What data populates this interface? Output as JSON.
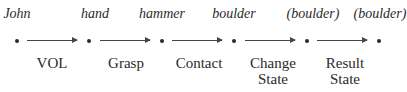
{
  "nodes": [
    {
      "label": "John",
      "x": 17
    },
    {
      "label": "hand",
      "x": 89
    },
    {
      "label": "hammer",
      "x": 162
    },
    {
      "label": "boulder",
      "x": 234
    },
    {
      "label": "(boulder)",
      "x": 307
    },
    {
      "label": "(boulder)",
      "x": 379
    }
  ],
  "edges": [
    {
      "line1": "VOL",
      "line2": ""
    },
    {
      "line1": "Grasp",
      "line2": ""
    },
    {
      "line1": "Contact",
      "line2": ""
    },
    {
      "line1": "Change",
      "line2": "State"
    },
    {
      "line1": "Result",
      "line2": "State"
    }
  ]
}
